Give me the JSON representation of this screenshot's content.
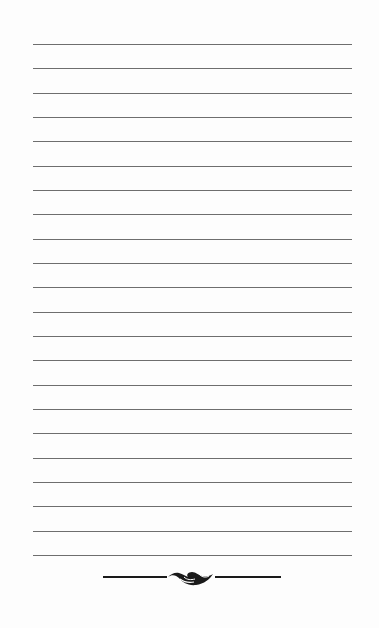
{
  "page": {
    "type": "lined-notepaper",
    "line_count": 22,
    "first_line_y": 44,
    "line_spacing": 24.33,
    "line_color": "#6e6e6e",
    "background_color": "#fdfdfd"
  },
  "ornament": {
    "name": "scroll-flourish",
    "color": "#1a1a1a"
  }
}
